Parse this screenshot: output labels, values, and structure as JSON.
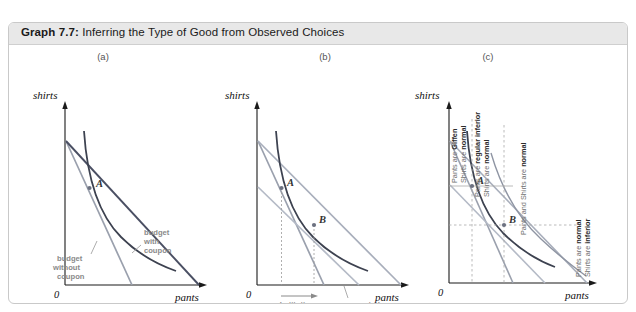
{
  "figure": {
    "title_prefix": "Graph 7.7:",
    "title_text": " Inferring the Type of Good from Observed Choices"
  },
  "panels": [
    {
      "id": "a",
      "label": "(a)",
      "y_axis_label": "shirts",
      "x_axis_label": "pants",
      "origin_label": "0",
      "points": [
        {
          "name": "A"
        }
      ],
      "annotations": [
        {
          "name": "budget-with-coupon",
          "lines": [
            "budget",
            "with",
            "coupon"
          ]
        },
        {
          "name": "budget-without-coupon",
          "lines": [
            "budget",
            "without",
            "coupon"
          ]
        }
      ]
    },
    {
      "id": "b",
      "label": "(b)",
      "y_axis_label": "shirts",
      "x_axis_label": "pants",
      "origin_label": "0",
      "points": [
        {
          "name": "A"
        },
        {
          "name": "B"
        }
      ],
      "annotations": [
        {
          "name": "substitution-effect",
          "lines": [
            "substitution",
            "effect"
          ]
        },
        {
          "name": "compensated-budget",
          "lines": [
            "compensated",
            "budget"
          ]
        }
      ]
    },
    {
      "id": "c",
      "label": "(c)",
      "y_axis_label": "shirts",
      "x_axis_label": "pants",
      "origin_label": "0",
      "points": [
        {
          "name": "A"
        },
        {
          "name": "B"
        }
      ],
      "regions": [
        {
          "name": "giffen-region",
          "line1_plain": "Pants are ",
          "line1_bold": "Giffen",
          "line2_plain": "Shirts are ",
          "line2_bold": "normal"
        },
        {
          "name": "regular-inferior-region",
          "line1_plain": "Pants are ",
          "line1_bold": "regular inferior",
          "line2_plain": "Shirts are ",
          "line2_bold": "normal"
        },
        {
          "name": "both-normal-region",
          "line1_plain": "Pants and Shirts are ",
          "line1_bold": "normal",
          "line2_plain": "",
          "line2_bold": ""
        },
        {
          "name": "shirts-inferior-region",
          "line1_plain": "Pants are ",
          "line1_bold": "normal",
          "line2_plain": "Shirts are ",
          "line2_bold": "inferior"
        }
      ]
    }
  ],
  "colors": {
    "budget_dark": "#4a4f63",
    "budget_light": "#9aa0ad",
    "indifference": "#3d4250",
    "annotation_gray": "#8a8a8a",
    "axis": "#1a1a1a",
    "grid": "#b9b9b9",
    "title_bar": "#e8e8e8"
  }
}
